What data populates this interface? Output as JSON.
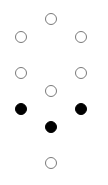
{
  "diagram": {
    "type": "dot-pattern",
    "width": 108,
    "height": 185,
    "radius": 6,
    "colors": {
      "empty_stroke": "#7a7a7a",
      "filled": "#000000",
      "background": "#ffffff"
    },
    "dots": [
      {
        "x": 51,
        "y": 19,
        "filled": false
      },
      {
        "x": 21,
        "y": 37,
        "filled": false
      },
      {
        "x": 81,
        "y": 37,
        "filled": false
      },
      {
        "x": 21,
        "y": 73,
        "filled": false
      },
      {
        "x": 81,
        "y": 73,
        "filled": false
      },
      {
        "x": 51,
        "y": 91,
        "filled": false
      },
      {
        "x": 21,
        "y": 109,
        "filled": true
      },
      {
        "x": 81,
        "y": 109,
        "filled": true
      },
      {
        "x": 51,
        "y": 127,
        "filled": true
      },
      {
        "x": 51,
        "y": 163,
        "filled": false
      }
    ]
  }
}
